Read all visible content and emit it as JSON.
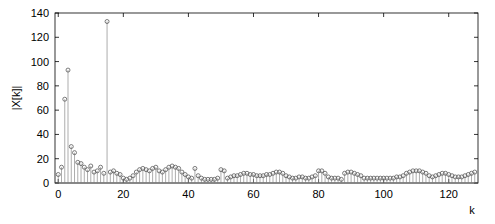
{
  "figure": {
    "title": "",
    "background_color": "#ffffff"
  },
  "axes": {
    "ylabel": "|X[k]|",
    "xlabel": "k",
    "y_ticks": [
      "0",
      "20",
      "40",
      "60",
      "80",
      "100",
      "120",
      "140"
    ],
    "x_ticks": [
      "0",
      "20",
      "40",
      "60",
      "80",
      "100",
      "120"
    ]
  },
  "chart_data": {
    "type": "line",
    "plot_style": "stem",
    "title": "",
    "subtitle": "",
    "xlabel": "k",
    "ylabel": "|X[k]|",
    "xlim": [
      -1,
      129
    ],
    "ylim": [
      0,
      140
    ],
    "xticks": [
      0,
      20,
      40,
      60,
      80,
      100,
      120
    ],
    "yticks": [
      0,
      20,
      40,
      60,
      80,
      100,
      120,
      140
    ],
    "grid": false,
    "legend": null,
    "legend_position": "none",
    "marker": "circle-open",
    "marker_color": "#5a5a5a",
    "line_color": "#8a8a8a",
    "annotations": [],
    "x": [
      0,
      1,
      2,
      3,
      4,
      5,
      6,
      7,
      8,
      9,
      10,
      11,
      12,
      13,
      14,
      15,
      16,
      17,
      18,
      19,
      20,
      21,
      22,
      23,
      24,
      25,
      26,
      27,
      28,
      29,
      30,
      31,
      32,
      33,
      34,
      35,
      36,
      37,
      38,
      39,
      40,
      41,
      42,
      43,
      44,
      45,
      46,
      47,
      48,
      49,
      50,
      51,
      52,
      53,
      54,
      55,
      56,
      57,
      58,
      59,
      60,
      61,
      62,
      63,
      64,
      65,
      66,
      67,
      68,
      69,
      70,
      71,
      72,
      73,
      74,
      75,
      76,
      77,
      78,
      79,
      80,
      81,
      82,
      83,
      84,
      85,
      86,
      87,
      88,
      89,
      90,
      91,
      92,
      93,
      94,
      95,
      96,
      97,
      98,
      99,
      100,
      101,
      102,
      103,
      104,
      105,
      106,
      107,
      108,
      109,
      110,
      111,
      112,
      113,
      114,
      115,
      116,
      117,
      118,
      119,
      120,
      121,
      122,
      123,
      124,
      125,
      126,
      127,
      128
    ],
    "values": [
      7,
      13,
      69,
      93,
      30,
      25,
      17,
      16,
      13,
      11,
      14,
      9,
      10,
      13,
      8,
      133,
      9,
      10,
      8,
      7,
      4,
      3,
      4,
      6,
      9,
      11,
      12,
      11,
      10,
      12,
      13,
      10,
      9,
      11,
      13,
      14,
      13,
      12,
      9,
      7,
      5,
      4,
      12,
      6,
      4,
      3,
      3,
      3,
      3,
      4,
      11,
      10,
      4,
      5,
      6,
      6,
      7,
      8,
      8,
      7,
      7,
      6,
      6,
      6,
      7,
      7,
      8,
      9,
      9,
      8,
      6,
      5,
      4,
      4,
      5,
      5,
      4,
      4,
      5,
      6,
      10,
      10,
      8,
      5,
      4,
      4,
      4,
      3,
      8,
      9,
      9,
      8,
      7,
      6,
      4,
      4,
      4,
      4,
      4,
      4,
      4,
      4,
      4,
      4,
      5,
      5,
      6,
      8,
      9,
      10,
      10,
      10,
      9,
      8,
      6,
      5,
      6,
      7,
      8,
      8,
      7,
      6,
      5,
      5,
      5,
      6,
      7,
      8,
      9
    ],
    "peaks": [
      {
        "k": 15,
        "magnitude": 133
      },
      {
        "k": 3,
        "magnitude": 93
      },
      {
        "k": 2,
        "magnitude": 69
      },
      {
        "k": 4,
        "magnitude": 30
      },
      {
        "k": 5,
        "magnitude": 25
      }
    ],
    "series": [
      {
        "name": "|X[k]|",
        "values": [
          7,
          13,
          69,
          93,
          30,
          25,
          17,
          16,
          13,
          11,
          14,
          9,
          10,
          13,
          8,
          133,
          9,
          10,
          8,
          7,
          4,
          3,
          4,
          6,
          9,
          11,
          12,
          11,
          10,
          12,
          13,
          10,
          9,
          11,
          13,
          14,
          13,
          12,
          9,
          7,
          5,
          4,
          12,
          6,
          4,
          3,
          3,
          3,
          3,
          4,
          11,
          10,
          4,
          5,
          6,
          6,
          7,
          8,
          8,
          7,
          7,
          6,
          6,
          6,
          7,
          7,
          8,
          9,
          9,
          8,
          6,
          5,
          4,
          4,
          5,
          5,
          4,
          4,
          5,
          6,
          10,
          10,
          8,
          5,
          4,
          4,
          4,
          3,
          8,
          9,
          9,
          8,
          7,
          6,
          4,
          4,
          4,
          4,
          4,
          4,
          4,
          4,
          4,
          4,
          5,
          5,
          6,
          8,
          9,
          10,
          10,
          10,
          9,
          8,
          6,
          5,
          6,
          7,
          8,
          8,
          7,
          6,
          5,
          5,
          5,
          6,
          7,
          8,
          9
        ]
      }
    ]
  }
}
